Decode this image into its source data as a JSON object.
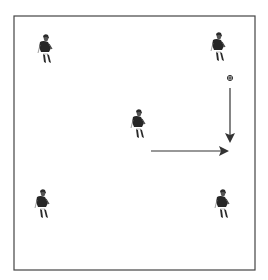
{
  "diagram": {
    "type": "soccer-drill",
    "field": {
      "x": 14,
      "y": 16,
      "width": 241,
      "height": 254,
      "stroke": "#444444"
    },
    "players": [
      {
        "id": "player-top-left",
        "x": 45,
        "y": 50
      },
      {
        "id": "player-top-right",
        "x": 218,
        "y": 48
      },
      {
        "id": "player-center",
        "x": 138,
        "y": 125
      },
      {
        "id": "player-bottom-left",
        "x": 42,
        "y": 205
      },
      {
        "id": "player-bottom-right",
        "x": 222,
        "y": 205
      }
    ],
    "ball": {
      "x": 230,
      "y": 78
    },
    "arrows": [
      {
        "id": "pass-arrow",
        "x1": 230,
        "y1": 88,
        "x2": 230,
        "y2": 141,
        "meaning": "ball path"
      },
      {
        "id": "run-arrow",
        "x1": 151,
        "y1": 151,
        "x2": 227,
        "y2": 151,
        "meaning": "player run"
      }
    ],
    "colors": {
      "ink": "#2a2a2a",
      "arrow": "#333333",
      "background": "#ffffff"
    }
  }
}
